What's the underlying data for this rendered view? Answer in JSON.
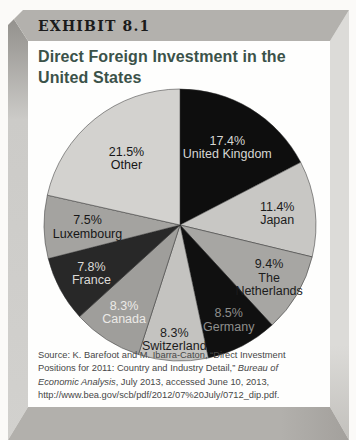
{
  "header": {
    "exhibit_label": "EXHIBIT 8.1"
  },
  "title": {
    "line1": "Direct Foreign Investment in the",
    "line2": "United States",
    "color": "#3b5249"
  },
  "source": {
    "prefix": "Source: K. Barefoot and M. Ibarra-Caton, “Direct Investment Positions for 2011: Country and Industry Detail,” ",
    "italic": "Bureau of Economic Analysis",
    "suffix": ", July 2013, accessed June 10, 2013, http://www.bea.gov/scb/pdf/2012/07%20July/0712_dip.pdf."
  },
  "frame_colors": {
    "top_band": "#b3b1ad",
    "bottom_band": "#b2b0ac",
    "left_strip": "#cccbc8",
    "right_strip": "#dcdbd8",
    "panel": "#fefefd"
  },
  "chart_data": {
    "type": "pie",
    "title": "Direct Foreign Investment in the United States",
    "start_angle_deg_from_top": 0,
    "direction": "clockwise",
    "slice_stroke": "#2d2d2d",
    "slices": [
      {
        "label": "United Kingdom",
        "value": 17.4,
        "color": "#0e0e0e",
        "text_color": "#d6d6d4",
        "label_r": 0.67,
        "lines": [
          "17.4%",
          "United Kingdom"
        ]
      },
      {
        "label": "Japan",
        "value": 11.4,
        "color": "#c8c7c4",
        "text_color": "#1c1c1c",
        "label_r": 0.72,
        "lines": [
          "11.4%",
          "Japan"
        ]
      },
      {
        "label": "The Netherlands",
        "value": 9.4,
        "color": "#a7a6a3",
        "text_color": "#1c1c1c",
        "label_r": 0.76,
        "lines": [
          "9.4%",
          "The",
          "Netherlands"
        ]
      },
      {
        "label": "Germany",
        "value": 8.5,
        "color": "#101010",
        "text_color": "#8e8e8c",
        "label_r": 0.78,
        "lines": [
          "8.5%",
          "Germany"
        ]
      },
      {
        "label": "Switzerland",
        "value": 8.3,
        "color": "#c4c3c0",
        "text_color": "#1c1c1c",
        "label_r": 0.84,
        "lines": [
          "8.3%",
          "Switzerland"
        ]
      },
      {
        "label": "Canada",
        "value": 8.3,
        "color": "#9f9e9b",
        "text_color": "#eceae7",
        "label_r": 0.76,
        "lines": [
          "8.3%",
          "Canada"
        ]
      },
      {
        "label": "France",
        "value": 7.8,
        "color": "#282828",
        "text_color": "#dbdad7",
        "label_r": 0.74,
        "lines": [
          "7.8%",
          "France"
        ]
      },
      {
        "label": "Luxembourg",
        "value": 7.5,
        "color": "#a4a3a0",
        "text_color": "#161616",
        "label_r": 0.68,
        "lines": [
          "7.5%",
          "Luxembourg"
        ]
      },
      {
        "label": "Other",
        "value": 21.5,
        "color": "#d3d2cf",
        "text_color": "#161616",
        "label_r": 0.63,
        "lines": [
          "21.5%",
          "Other"
        ]
      }
    ]
  }
}
